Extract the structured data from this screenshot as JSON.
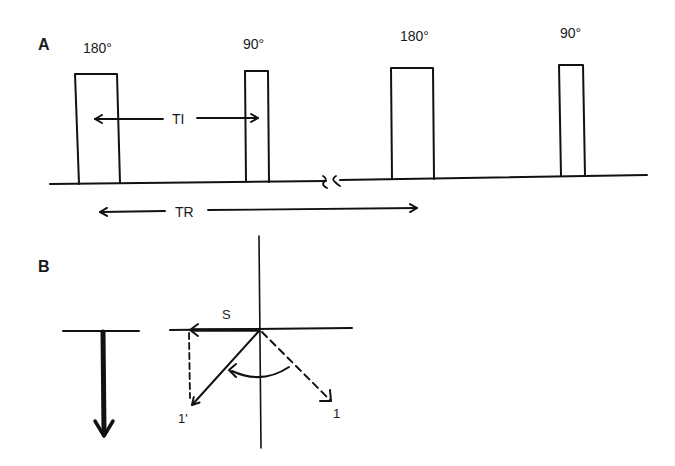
{
  "panels": {
    "a": {
      "label": "A",
      "pulses": [
        {
          "label": "180°",
          "kind": "inversion"
        },
        {
          "label": "90°",
          "kind": "excitation"
        },
        {
          "label": "180°",
          "kind": "inversion"
        },
        {
          "label": "90°",
          "kind": "excitation"
        }
      ],
      "intervals": {
        "ti": "TI",
        "tr": "TR"
      },
      "axis_break": "≈"
    },
    "b": {
      "label": "B",
      "vectors": {
        "signal": "S",
        "rotated": "1'",
        "original": "1"
      }
    }
  }
}
